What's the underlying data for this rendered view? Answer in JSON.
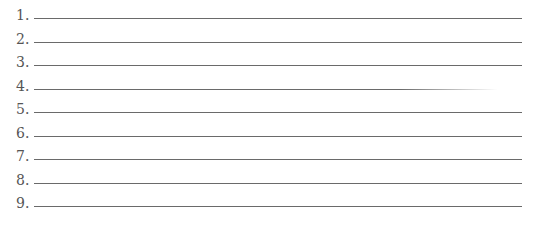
{
  "list": {
    "items": [
      {
        "number": "1."
      },
      {
        "number": "2."
      },
      {
        "number": "3."
      },
      {
        "number": "4."
      },
      {
        "number": "5."
      },
      {
        "number": "6."
      },
      {
        "number": "7."
      },
      {
        "number": "8."
      },
      {
        "number": "9."
      }
    ]
  }
}
